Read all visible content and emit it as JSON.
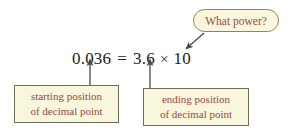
{
  "diagram": {
    "equation": {
      "left_value": "0.036",
      "equals": "=",
      "mantissa": "3.6",
      "times": "×",
      "base": "10",
      "exponent": ""
    },
    "callout": {
      "text": "What power?",
      "fill": "#f8f6dc",
      "border": "#8a8a4a",
      "text_color": "#9c4a3c"
    },
    "boxes": [
      {
        "id": "starting",
        "line1": "starting position",
        "line2": "of decimal point",
        "fill": "#f8f6dc",
        "border": "#6e6e52",
        "text_color": "#9c4a3c"
      },
      {
        "id": "ending",
        "line1": "ending position",
        "line2": "of decimal point",
        "fill": "#f8f6dc",
        "border": "#6e6e52",
        "text_color": "#9c4a3c"
      }
    ],
    "arrows": [
      {
        "name": "starting-decimal-arrow",
        "from": "starting position box",
        "to": "decimal point in 0.036"
      },
      {
        "name": "ending-decimal-arrow",
        "from": "ending position box",
        "to": "decimal point in 3.6"
      },
      {
        "name": "callout-arrow",
        "from": "What power? bubble",
        "to": "exponent of 10"
      }
    ],
    "colors": {
      "equation_text": "#1c1c1c",
      "annotation_text": "#9c4a3c",
      "panel_fill": "#f8f6dc",
      "arrow": "#4a4a4a",
      "background": "#ffffff"
    }
  }
}
